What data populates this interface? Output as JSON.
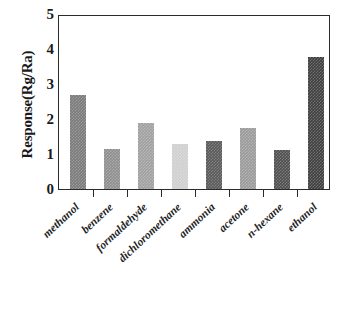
{
  "chart_data": {
    "type": "bar",
    "title": "",
    "xlabel": "",
    "ylabel": "Response(Rg/Ra)",
    "categories": [
      "methanol",
      "benzene",
      "formaldehyde",
      "dichloromethane",
      "ammonia",
      "acetone",
      "n-hexane",
      "ethanol"
    ],
    "values": [
      2.7,
      1.13,
      1.9,
      1.28,
      1.36,
      1.73,
      1.12,
      3.78
    ],
    "bar_colors": [
      "#7a7a7a",
      "#8f8f8f",
      "#a0a0a0",
      "#cfcfcf",
      "#595959",
      "#9a9a9a",
      "#4f4f4f",
      "#3f3f3f"
    ],
    "ylim": [
      0,
      5
    ],
    "yticks": [
      0,
      1,
      2,
      3,
      4,
      5
    ],
    "ytick_labels": [
      "0",
      "1",
      "2",
      "3",
      "4",
      "5"
    ],
    "grid": false,
    "legend": null,
    "frame_color": "#2b2b2b",
    "background": "#ffffff"
  }
}
